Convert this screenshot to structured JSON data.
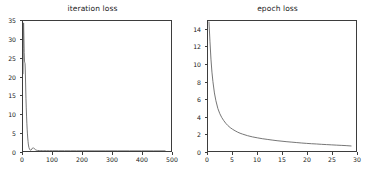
{
  "figure": {
    "background": "#ffffff",
    "line_color": "#666666",
    "axis_color": "#3d3d3d",
    "text_color": "#1a1a1a"
  },
  "chart_data": [
    {
      "type": "line",
      "title": "iteration loss",
      "xlabel": "",
      "ylabel": "",
      "xlim": [
        0,
        500
      ],
      "ylim": [
        0,
        35
      ],
      "grid": false,
      "legend": null,
      "xticks": [
        0,
        100,
        200,
        300,
        400,
        500
      ],
      "yticks": [
        0,
        5,
        10,
        15,
        20,
        25,
        30,
        35
      ],
      "series": [
        {
          "name": "iteration loss",
          "color": "#666666",
          "x": [
            0,
            1,
            2,
            3,
            4,
            5,
            6,
            7,
            8,
            9,
            10,
            11,
            12,
            13,
            14,
            15,
            16,
            17,
            18,
            19,
            20,
            22,
            24,
            26,
            28,
            30,
            32,
            34,
            36,
            38,
            40,
            42,
            44,
            46,
            48,
            50,
            55,
            60,
            65,
            70,
            80,
            90,
            100,
            120,
            140,
            160,
            180,
            200,
            240,
            280,
            320,
            360,
            400,
            440,
            480
          ],
          "y": [
            20.8,
            27.5,
            34.5,
            31.0,
            26.5,
            24.2,
            23.8,
            23.5,
            21.0,
            17.5,
            14.2,
            11.6,
            9.4,
            7.5,
            5.9,
            4.6,
            3.5,
            2.6,
            1.9,
            1.35,
            0.95,
            0.5,
            0.28,
            0.2,
            0.3,
            0.55,
            0.78,
            0.88,
            0.82,
            0.66,
            0.5,
            0.36,
            0.26,
            0.2,
            0.16,
            0.14,
            0.11,
            0.1,
            0.09,
            0.085,
            0.08,
            0.075,
            0.07,
            0.065,
            0.06,
            0.058,
            0.055,
            0.052,
            0.05,
            0.048,
            0.046,
            0.044,
            0.042,
            0.04,
            0.04
          ]
        }
      ]
    },
    {
      "type": "line",
      "title": "epoch loss",
      "xlabel": "",
      "ylabel": "",
      "xlim": [
        0,
        30
      ],
      "ylim": [
        0,
        15
      ],
      "grid": false,
      "legend": null,
      "xticks": [
        0,
        5,
        10,
        15,
        20,
        25,
        30
      ],
      "yticks": [
        0,
        2,
        4,
        6,
        8,
        10,
        12,
        14
      ],
      "series": [
        {
          "name": "epoch loss",
          "color": "#666666",
          "x": [
            0.2,
            0.4,
            0.6,
            0.8,
            1.0,
            1.3,
            1.6,
            2.0,
            2.4,
            2.8,
            3.2,
            3.6,
            4.0,
            4.5,
            5.0,
            5.5,
            6.0,
            6.5,
            7.0,
            8.0,
            9.0,
            10.0,
            11.0,
            12.0,
            13.0,
            14.0,
            15.0,
            16.0,
            17.0,
            18.0,
            19.0,
            20.0,
            21.0,
            22.0,
            23.0,
            24.0,
            25.0,
            26.0,
            27.0,
            28.0,
            29.0
          ],
          "y": [
            14.9,
            12.6,
            10.6,
            9.1,
            8.0,
            6.7,
            5.8,
            4.9,
            4.3,
            3.85,
            3.5,
            3.2,
            2.95,
            2.7,
            2.5,
            2.33,
            2.18,
            2.05,
            1.95,
            1.77,
            1.63,
            1.52,
            1.42,
            1.34,
            1.26,
            1.19,
            1.13,
            1.07,
            1.02,
            0.97,
            0.92,
            0.88,
            0.84,
            0.81,
            0.77,
            0.74,
            0.71,
            0.68,
            0.65,
            0.62,
            0.58
          ]
        }
      ]
    }
  ]
}
